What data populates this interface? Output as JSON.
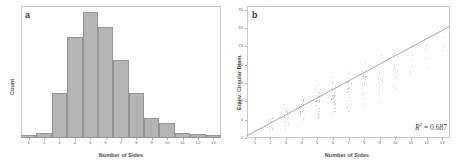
{
  "figure": {
    "panels": [
      {
        "letter": "a",
        "xlabel": "Number of Sides",
        "ylabel": "Count"
      },
      {
        "letter": "b",
        "xlabel": "Number of Sides",
        "ylabel": "Equiv. Circular Diam.",
        "annotation": {
          "symbol": "R",
          "exponent": "2",
          "equals": " = 0.687",
          "full": "R2 = 0.687"
        }
      }
    ]
  },
  "colors": {
    "bar_fill": "#b4b4b4",
    "bar_stroke": "#949494",
    "frame": "#c8c8c8",
    "point": "#9a9a9a",
    "regression_line": "#9a9a9a",
    "text": "#4a4a4a"
  },
  "chart_data": [
    {
      "type": "bar",
      "title": "",
      "panel": "a",
      "xlabel": "Number of Sides",
      "ylabel": "Count",
      "categories": [
        "1",
        "2",
        "3",
        "4",
        "5",
        "6",
        "7",
        "8",
        "9",
        "10",
        "11",
        "12",
        "13"
      ],
      "xtick_labels": [
        "1",
        "2",
        "3",
        "4",
        "5",
        "6",
        "7",
        "8",
        "9",
        "10",
        "11",
        "12",
        "13"
      ],
      "values": [
        2,
        4,
        36,
        80,
        100,
        88,
        62,
        36,
        16,
        12,
        4,
        3,
        2
      ],
      "xlim": [
        0.5,
        13.5
      ],
      "ylim": [
        0,
        105
      ],
      "grid": false,
      "legend": "none"
    },
    {
      "type": "scatter",
      "title": "",
      "panel": "b",
      "xlabel": "Number of Sides",
      "ylabel": "Equiv. Circular Diam.",
      "xtick_labels": [
        "1",
        "2",
        "3",
        "4",
        "5",
        "6",
        "7",
        "8",
        "9",
        "10",
        "11",
        "12",
        "13"
      ],
      "ytick_labels": [
        "0",
        "5",
        "10",
        "15",
        "20",
        "25",
        "30",
        "35"
      ],
      "xlim": [
        0.5,
        13.5
      ],
      "ylim": [
        0,
        36
      ],
      "grid": false,
      "legend": "none",
      "annotation_r2": "R2 = 0.687",
      "r2_value": 0.687,
      "regression_line": {
        "x": [
          0.5,
          13.5
        ],
        "y": [
          0.6,
          30.5
        ]
      },
      "clusters": [
        {
          "x": 2,
          "y_min": 1,
          "y_max": 7,
          "n": 14,
          "y_center": 3
        },
        {
          "x": 3,
          "y_min": 1,
          "y_max": 11,
          "n": 24,
          "y_center": 4.5
        },
        {
          "x": 4,
          "y_min": 2,
          "y_max": 13,
          "n": 30,
          "y_center": 6
        },
        {
          "x": 5,
          "y_min": 2,
          "y_max": 17,
          "n": 36,
          "y_center": 7.5
        },
        {
          "x": 6,
          "y_min": 2,
          "y_max": 20,
          "n": 40,
          "y_center": 9
        },
        {
          "x": 7,
          "y_min": 3,
          "y_max": 22,
          "n": 38,
          "y_center": 11
        },
        {
          "x": 8,
          "y_min": 4,
          "y_max": 24,
          "n": 30,
          "y_center": 13
        },
        {
          "x": 9,
          "y_min": 5,
          "y_max": 27,
          "n": 22,
          "y_center": 15
        },
        {
          "x": 10,
          "y_min": 8,
          "y_max": 28,
          "n": 16,
          "y_center": 17
        },
        {
          "x": 11,
          "y_min": 14,
          "y_max": 26,
          "n": 8,
          "y_center": 19
        },
        {
          "x": 12,
          "y_min": 17,
          "y_max": 27,
          "n": 6,
          "y_center": 22
        },
        {
          "x": 13,
          "y_min": 22,
          "y_max": 30,
          "n": 4,
          "y_center": 26
        }
      ]
    }
  ]
}
